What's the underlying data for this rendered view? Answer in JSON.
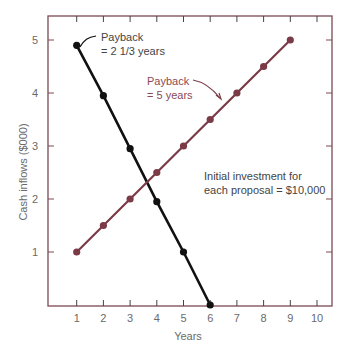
{
  "chart_data": {
    "type": "line",
    "title": "",
    "xlabel": "Years",
    "ylabel": "Cash inflows ($000)",
    "xlim": [
      0,
      10.5
    ],
    "ylim": [
      0,
      5.4
    ],
    "xticks": [
      "1",
      "2",
      "3",
      "4",
      "5",
      "6",
      "7",
      "8",
      "9",
      "10"
    ],
    "yticks": [
      "1",
      "2",
      "3",
      "4",
      "5"
    ],
    "grid": false,
    "series": [
      {
        "name": "Payback = 2 1/3 years",
        "color": "#111111",
        "x": [
          1,
          2,
          3,
          4,
          5,
          6
        ],
        "y": [
          4.9,
          3.95,
          2.95,
          1.95,
          1.0,
          0
        ]
      },
      {
        "name": "Payback = 5 years",
        "color": "#7a3b47",
        "x": [
          1,
          2,
          3,
          4,
          5,
          6,
          7,
          8,
          9
        ],
        "y": [
          1,
          1.5,
          2,
          2.5,
          3,
          3.5,
          4,
          4.5,
          5
        ]
      }
    ],
    "annotations": [
      {
        "id": "black",
        "lines": [
          "Payback",
          "= 2 1/3 years"
        ]
      },
      {
        "id": "red",
        "lines": [
          "Payback",
          "= 5 years"
        ]
      },
      {
        "id": "note",
        "lines": [
          "Initial investment for",
          "each proposal = $10,000"
        ]
      }
    ]
  }
}
